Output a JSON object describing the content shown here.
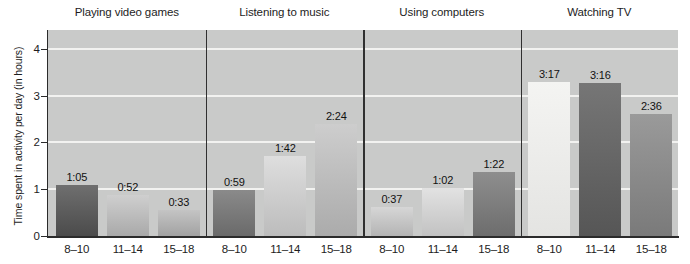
{
  "chart_data": {
    "type": "bar",
    "title": "",
    "xlabel": "",
    "ylabel": "Time spent in activity per day (in hours)",
    "ylim": [
      0,
      4.4
    ],
    "yticks": [
      0,
      1,
      2,
      3,
      4
    ],
    "ytick_labels": [
      "0",
      "1",
      "2",
      "3",
      "4"
    ],
    "grid": true,
    "gridlines_at": [
      1,
      2,
      3,
      4
    ],
    "legend": "none",
    "categories": [
      "8–10",
      "11–14",
      "15–18"
    ],
    "panels": [
      {
        "title": "Playing video games",
        "bars": [
          {
            "category": "8–10",
            "label": "1:05",
            "value_hours": 1.0833
          },
          {
            "category": "11–14",
            "label": "0:52",
            "value_hours": 0.8667
          },
          {
            "category": "15–18",
            "label": "0:33",
            "value_hours": 0.55
          }
        ]
      },
      {
        "title": "Listening to music",
        "bars": [
          {
            "category": "8–10",
            "label": "0:59",
            "value_hours": 0.9833
          },
          {
            "category": "11–14",
            "label": "1:42",
            "value_hours": 1.7
          },
          {
            "category": "15–18",
            "label": "2:24",
            "value_hours": 2.4
          }
        ]
      },
      {
        "title": "Using computers",
        "bars": [
          {
            "category": "8–10",
            "label": "0:37",
            "value_hours": 0.6167
          },
          {
            "category": "11–14",
            "label": "1:02",
            "value_hours": 1.0333
          },
          {
            "category": "15–18",
            "label": "1:22",
            "value_hours": 1.3667
          }
        ]
      },
      {
        "title": "Watching TV",
        "bars": [
          {
            "category": "8–10",
            "label": "3:17",
            "value_hours": 3.2833
          },
          {
            "category": "11–14",
            "label": "3:16",
            "value_hours": 3.2667
          },
          {
            "category": "15–18",
            "label": "2:36",
            "value_hours": 2.6
          }
        ]
      }
    ],
    "colors": {
      "plot_background": "#c9cac9",
      "gridline": "#f2f2f0",
      "axis": "#2b2b2b",
      "separator": "#303030",
      "text": "#1d1d1d",
      "bar_shades": [
        [
          "#6f6f6f",
          "#4b4b4b"
        ],
        [
          "#cfcfcf",
          "#a9a9a9"
        ],
        [
          "#c4c4c4",
          "#a2a2a2"
        ],
        [
          "#8a8a8a",
          "#6a6a6a"
        ],
        [
          "#dedede",
          "#bcbcbc"
        ],
        [
          "#cdcdcd",
          "#ababab"
        ],
        [
          "#d6d6d6",
          "#b4b4b4"
        ],
        [
          "#e2e2e2",
          "#c2c2c2"
        ],
        [
          "#8e8e8e",
          "#6d6d6d"
        ],
        [
          "#f4f4f2",
          "#e4e4e2"
        ],
        [
          "#767676",
          "#565656"
        ],
        [
          "#9a9a9a",
          "#7a7a7a"
        ]
      ]
    }
  }
}
